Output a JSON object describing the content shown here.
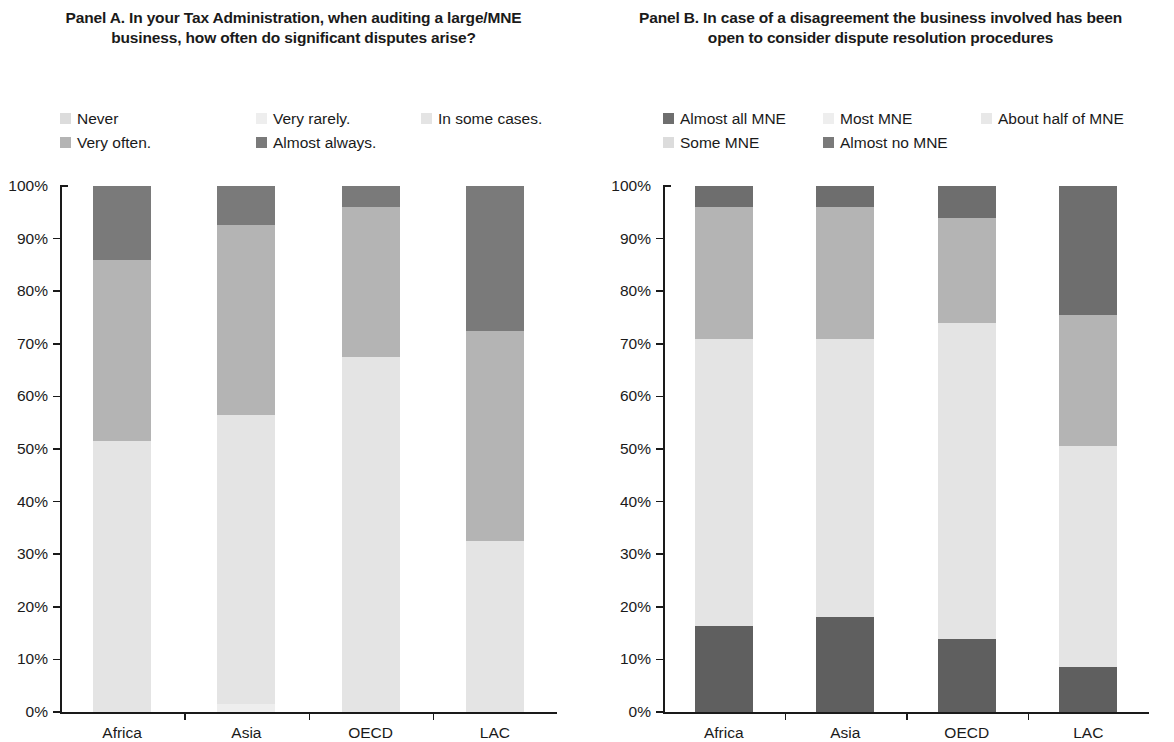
{
  "panels": [
    {
      "id": "panel-a",
      "title": "Panel A. In your Tax Administration, when auditing a large/MNE business, how often do significant disputes arise?",
      "legend": [
        {
          "label": "Never",
          "color": "#dcdcdc"
        },
        {
          "label": "Very rarely.",
          "color": "#eeeeee"
        },
        {
          "label": "In some cases.",
          "color": "#e4e4e4"
        },
        {
          "label": "Very often.",
          "color": "#b4b4b4"
        },
        {
          "label": "Almost always.",
          "color": "#7a7a7a"
        }
      ],
      "chart_data": {
        "type": "bar",
        "stacked": true,
        "title": "Panel A. In your Tax Administration, when auditing a large/MNE business, how often do significant disputes arise?",
        "xlabel": "",
        "ylabel": "",
        "ylim": [
          0,
          100
        ],
        "ytick_labels": [
          "0%",
          "10%",
          "20%",
          "30%",
          "40%",
          "50%",
          "60%",
          "70%",
          "80%",
          "90%",
          "100%"
        ],
        "ytick_values": [
          0,
          10,
          20,
          30,
          40,
          50,
          60,
          70,
          80,
          90,
          100
        ],
        "grid": false,
        "legend_position": "top",
        "categories": [
          "Africa",
          "Asia",
          "OECD",
          "LAC"
        ],
        "series": [
          {
            "name": "Never",
            "color": "#dcdcdc",
            "values": [
              0,
              0,
              0,
              0
            ]
          },
          {
            "name": "Very rarely.",
            "color": "#eeeeee",
            "values": [
              0,
              1.5,
              0,
              0
            ]
          },
          {
            "name": "In some cases.",
            "color": "#e4e4e4",
            "values": [
              51.5,
              55,
              67.5,
              32.5
            ]
          },
          {
            "name": "Very often.",
            "color": "#b4b4b4",
            "values": [
              34.5,
              36,
              28.5,
              40
            ]
          },
          {
            "name": "Almost always.",
            "color": "#7a7a7a",
            "values": [
              14,
              7.5,
              4,
              27.5
            ]
          }
        ]
      }
    },
    {
      "id": "panel-b",
      "title": "Panel B. In case of a disagreement the business involved has been open to consider dispute resolution procedures",
      "legend": [
        {
          "label": "Almost all MNE",
          "color": "#6e6e6e"
        },
        {
          "label": "Most MNE",
          "color": "#eeeeee"
        },
        {
          "label": "About half of MNE",
          "color": "#e8e8e8"
        },
        {
          "label": "Some MNE",
          "color": "#dcdcdc"
        },
        {
          "label": "Almost no MNE",
          "color": "#7a7a7a"
        }
      ],
      "chart_data": {
        "type": "bar",
        "stacked": true,
        "title": "Panel B. In case of a disagreement the business involved has been open to consider dispute resolution procedures",
        "xlabel": "",
        "ylabel": "",
        "ylim": [
          0,
          100
        ],
        "ytick_labels": [
          "0%",
          "10%",
          "20%",
          "30%",
          "40%",
          "50%",
          "60%",
          "70%",
          "80%",
          "90%",
          "100%"
        ],
        "ytick_values": [
          0,
          10,
          20,
          30,
          40,
          50,
          60,
          70,
          80,
          90,
          100
        ],
        "grid": false,
        "legend_position": "top",
        "categories": [
          "Africa",
          "Asia",
          "OECD",
          "LAC"
        ],
        "series": [
          {
            "name": "Almost no MNE",
            "color": "#5f5f5f",
            "values": [
              16.3,
              18,
              13.8,
              8.5
            ]
          },
          {
            "name": "Some MNE",
            "color": "#e4e4e4",
            "values": [
              54.7,
              53,
              60.2,
              42
            ]
          },
          {
            "name": "About half of MNE",
            "color": "#b4b4b4",
            "values": [
              25,
              25,
              20,
              25
            ]
          },
          {
            "name": "Most MNE",
            "color": "#6e6e6e",
            "values": [
              4,
              4,
              6,
              24.5
            ]
          },
          {
            "name": "Almost all MNE",
            "color": "#6e6e6e",
            "values": [
              0,
              0,
              0,
              0
            ]
          }
        ]
      }
    }
  ]
}
